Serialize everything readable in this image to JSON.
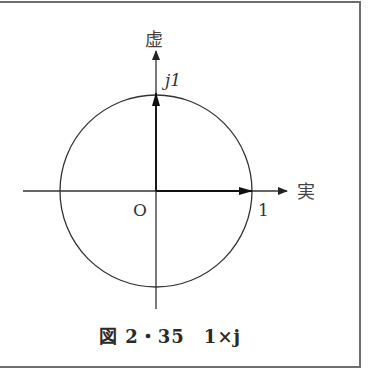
{
  "figure": {
    "axis_imag_label": "虚",
    "axis_real_label": "実",
    "origin_label": "O",
    "imag_point_label": "j1",
    "real_point_label": "1",
    "caption": "図 2・35　1×j",
    "vectors": [
      {
        "name": "real-unit-vector",
        "re": 1,
        "im": 0
      },
      {
        "name": "imag-unit-vector",
        "re": 0,
        "im": 1
      }
    ],
    "circle": {
      "radius": 1,
      "center": [
        0,
        0
      ]
    }
  }
}
